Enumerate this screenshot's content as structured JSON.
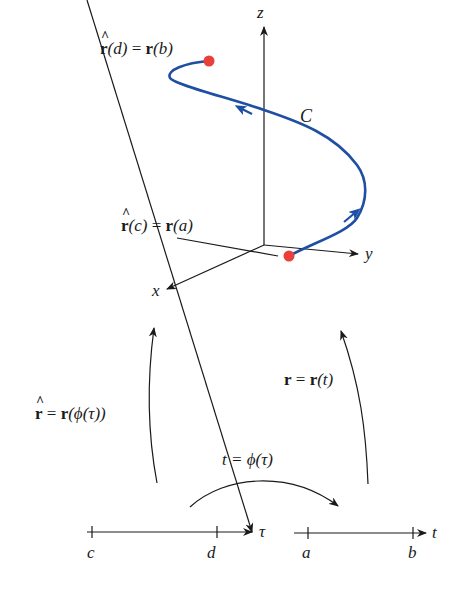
{
  "diagram": {
    "type": "reparametrization-of-space-curve",
    "colors": {
      "curve": "#1f4fa3",
      "endpoint": "#e8403a",
      "axis": "#1a1a1a"
    },
    "axes_3d": {
      "x_label": "x",
      "y_label": "y",
      "z_label": "z"
    },
    "curve_label": "C",
    "end_point_label": {
      "lhs_func": "r",
      "lhs_arg": "(d)",
      "eq": "=",
      "rhs_func": "r",
      "rhs_arg": "(b)"
    },
    "start_point_label": {
      "lhs_func": "r",
      "lhs_arg": "(c)",
      "eq": "=",
      "rhs_func": "r",
      "rhs_arg": "(a)"
    },
    "left_map_label": {
      "lhs": "r",
      "eq": "=",
      "rhs_func": "r",
      "rhs_arg": "(ϕ(τ))"
    },
    "right_map_label": {
      "lhs": "r",
      "eq": "=",
      "rhs_func": "r",
      "rhs_arg": "(t)"
    },
    "phi_map_label": "t = ϕ(τ)",
    "tau_axis": {
      "name": "τ",
      "ticks": [
        "c",
        "d"
      ]
    },
    "t_axis": {
      "name": "t",
      "ticks": [
        "a",
        "b"
      ]
    }
  }
}
